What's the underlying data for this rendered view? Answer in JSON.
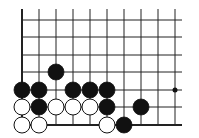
{
  "board": {
    "description": "Go problem diagram, lower-left corner of board",
    "columns_x": [
      22,
      39,
      56,
      73,
      90,
      107,
      124,
      141,
      158,
      175
    ],
    "rows_y": [
      20,
      37,
      55,
      72,
      90,
      107,
      125
    ],
    "line_extent": {
      "left": 22,
      "right": 182,
      "top": 9,
      "bottom": 125
    },
    "left_edge_is_border": true,
    "bottom_edge_is_border": true,
    "stone_radius": 8,
    "colors": {
      "black": "#111111",
      "white": "#ffffff",
      "line": "#222222"
    },
    "star_points": [
      {
        "col": 9,
        "row": 4
      }
    ],
    "stones": [
      {
        "col": 2,
        "row": 3,
        "color": "black"
      },
      {
        "col": 0,
        "row": 4,
        "color": "black"
      },
      {
        "col": 1,
        "row": 4,
        "color": "black"
      },
      {
        "col": 3,
        "row": 4,
        "color": "black"
      },
      {
        "col": 4,
        "row": 4,
        "color": "black"
      },
      {
        "col": 5,
        "row": 4,
        "color": "black"
      },
      {
        "col": 0,
        "row": 5,
        "color": "white"
      },
      {
        "col": 1,
        "row": 5,
        "color": "black"
      },
      {
        "col": 2,
        "row": 5,
        "color": "white"
      },
      {
        "col": 3,
        "row": 5,
        "color": "white"
      },
      {
        "col": 4,
        "row": 5,
        "color": "white"
      },
      {
        "col": 5,
        "row": 5,
        "color": "black"
      },
      {
        "col": 7,
        "row": 5,
        "color": "black"
      },
      {
        "col": 0,
        "row": 6,
        "color": "white"
      },
      {
        "col": 1,
        "row": 6,
        "color": "white"
      },
      {
        "col": 5,
        "row": 6,
        "color": "white"
      },
      {
        "col": 6,
        "row": 6,
        "color": "black"
      }
    ]
  }
}
